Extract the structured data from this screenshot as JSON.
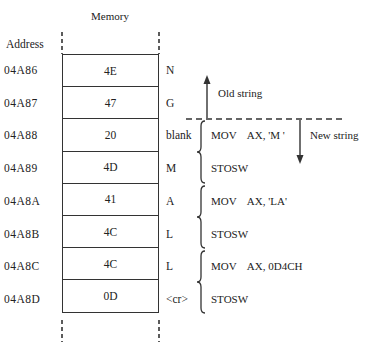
{
  "diagram": {
    "column_title": "Memory",
    "address_header": "Address",
    "rows": [
      {
        "address": "04A86",
        "value": "4E",
        "char": "N"
      },
      {
        "address": "04A87",
        "value": "47",
        "char": "G"
      },
      {
        "address": "04A88",
        "value": "20",
        "char": "blank"
      },
      {
        "address": "04A89",
        "value": "4D",
        "char": "M"
      },
      {
        "address": "04A8A",
        "value": "41",
        "char": "A"
      },
      {
        "address": "04A8B",
        "value": "4C",
        "char": "L"
      },
      {
        "address": "04A8C",
        "value": "4C",
        "char": "L"
      },
      {
        "address": "04A8D",
        "value": "0D",
        "char": "<cr>"
      }
    ],
    "instructions": [
      {
        "text": "MOV    AX, 'M '"
      },
      {
        "text": "STOSW"
      },
      {
        "text": "MOV    AX, 'LA'"
      },
      {
        "text": "STOSW"
      },
      {
        "text": "MOV    AX, 0D4CH"
      },
      {
        "text": "STOSW"
      }
    ],
    "old_string_label": "Old string",
    "new_string_label": "New string"
  }
}
